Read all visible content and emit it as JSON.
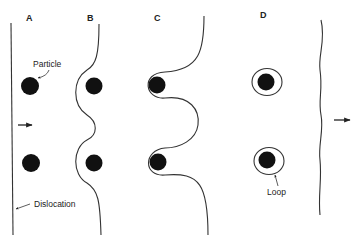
{
  "figure": {
    "panels": [
      {
        "id": "A",
        "label": "A"
      },
      {
        "id": "B",
        "label": "B"
      },
      {
        "id": "C",
        "label": "C"
      },
      {
        "id": "D",
        "label": "D"
      }
    ],
    "annotations": {
      "particle": "Particle",
      "dislocation": "Dislocation",
      "loop": "Loop"
    },
    "colors": {
      "line": "#333333",
      "particle": "#111111",
      "background": "#ffffff"
    }
  }
}
